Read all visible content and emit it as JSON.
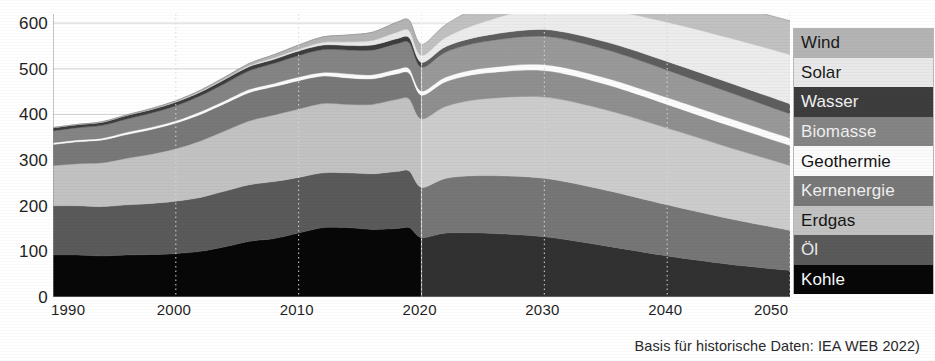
{
  "caption": "Basis für historische Daten: IEA WEB 2022)",
  "axes": {
    "y_ticks": [
      "0",
      "100",
      "200",
      "300",
      "400",
      "500",
      "600"
    ],
    "x_ticks": [
      "1990",
      "2000",
      "2010",
      "2020",
      "2030",
      "2040",
      "2050"
    ]
  },
  "legend": {
    "items": [
      {
        "label": "Wind",
        "color": "#b4b4b4",
        "text_color": "#1a1a1a"
      },
      {
        "label": "Solar",
        "color": "#e8e8e8",
        "text_color": "#1a1a1a"
      },
      {
        "label": "Wasser",
        "color": "#3d3d3d",
        "text_color": "#f2f2f2"
      },
      {
        "label": "Biomasse",
        "color": "#848484",
        "text_color": "#efefef"
      },
      {
        "label": "Geothermie",
        "color": "#fbfbfb",
        "text_color": "#141414"
      },
      {
        "label": "Kernenergie",
        "color": "#787878",
        "text_color": "#f0f0f0"
      },
      {
        "label": "Erdgas",
        "color": "#c2c2c2",
        "text_color": "#151515"
      },
      {
        "label": "Öl",
        "color": "#5a5a5a",
        "text_color": "#ececec"
      },
      {
        "label": "Kohle",
        "color": "#070707",
        "text_color": "#fafafa"
      }
    ]
  },
  "chart_data": {
    "type": "area",
    "title": "",
    "subtitle": "",
    "xlabel": "",
    "ylabel": "",
    "stacked": true,
    "grid": true,
    "legend_position": "right",
    "xlim": [
      1990,
      2050
    ],
    "ylim": [
      0,
      620
    ],
    "x": [
      1990,
      1992,
      1994,
      1996,
      1998,
      2000,
      2002,
      2004,
      2006,
      2008,
      2010,
      2012,
      2014,
      2016,
      2018,
      2019,
      2020,
      2022,
      2025,
      2030,
      2035,
      2040,
      2045,
      2050
    ],
    "series": [
      {
        "name": "Kohle",
        "color": "#070707",
        "values": [
          92,
          92,
          90,
          92,
          93,
          95,
          100,
          110,
          122,
          128,
          140,
          152,
          152,
          148,
          150,
          152,
          130,
          140,
          140,
          132,
          112,
          90,
          72,
          58
        ]
      },
      {
        "name": "Öl",
        "color": "#5a5a5a",
        "values": [
          108,
          108,
          108,
          110,
          112,
          115,
          118,
          122,
          124,
          125,
          122,
          120,
          120,
          122,
          125,
          124,
          110,
          120,
          126,
          128,
          122,
          112,
          100,
          88
        ]
      },
      {
        "name": "Erdgas",
        "color": "#c2c2c2",
        "values": [
          88,
          92,
          96,
          102,
          108,
          115,
          124,
          132,
          140,
          146,
          150,
          152,
          150,
          152,
          158,
          158,
          150,
          158,
          168,
          178,
          176,
          168,
          156,
          142
        ]
      },
      {
        "name": "Kernenergie",
        "color": "#787878",
        "values": [
          46,
          48,
          50,
          52,
          54,
          56,
          58,
          60,
          62,
          62,
          62,
          60,
          58,
          56,
          56,
          56,
          52,
          54,
          56,
          58,
          56,
          52,
          48,
          44
        ]
      },
      {
        "name": "Geothermie",
        "color": "#fbfbfb",
        "values": [
          4,
          4,
          4,
          5,
          5,
          5,
          6,
          6,
          7,
          7,
          8,
          8,
          9,
          9,
          10,
          10,
          9,
          10,
          11,
          13,
          14,
          15,
          16,
          16
        ]
      },
      {
        "name": "Biomasse",
        "color": "#848484",
        "values": [
          26,
          27,
          28,
          29,
          31,
          33,
          35,
          38,
          41,
          44,
          47,
          50,
          52,
          54,
          56,
          57,
          52,
          55,
          58,
          62,
          62,
          60,
          57,
          53
        ]
      },
      {
        "name": "Wasser",
        "color": "#3d3d3d",
        "values": [
          7,
          7,
          7,
          8,
          8,
          8,
          8,
          9,
          9,
          9,
          10,
          10,
          10,
          11,
          11,
          11,
          11,
          12,
          13,
          15,
          17,
          19,
          21,
          22
        ]
      },
      {
        "name": "Solar",
        "color": "#e8e8e8",
        "values": [
          0,
          0,
          0,
          0,
          0,
          1,
          1,
          1,
          2,
          3,
          4,
          6,
          8,
          10,
          14,
          15,
          15,
          20,
          30,
          50,
          70,
          86,
          98,
          108
        ]
      },
      {
        "name": "Wind",
        "color": "#b4b4b4",
        "values": [
          0,
          0,
          1,
          1,
          2,
          2,
          3,
          4,
          5,
          7,
          9,
          12,
          15,
          18,
          22,
          23,
          24,
          28,
          38,
          52,
          62,
          68,
          72,
          74
        ]
      }
    ]
  }
}
